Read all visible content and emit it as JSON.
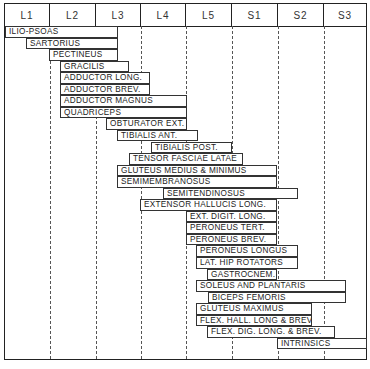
{
  "columns": [
    "L1",
    "L2",
    "L3",
    "L4",
    "L5",
    "S1",
    "S2",
    "S3"
  ],
  "colors": {
    "line": "#222222",
    "text": "#222222",
    "background": "#ffffff"
  },
  "muscles": [
    {
      "name": "ILIO-PSOAS",
      "x0": 5,
      "x1": 118
    },
    {
      "name": "SARTORIUS",
      "x0": 26,
      "x1": 118
    },
    {
      "name": "PECTINEUS",
      "x0": 49,
      "x1": 118
    },
    {
      "name": "GRACILIS",
      "x0": 60,
      "x1": 129
    },
    {
      "name": "ADDUCTOR LONG.",
      "x0": 60,
      "x1": 150
    },
    {
      "name": "ADDUCTOR BREV.",
      "x0": 60,
      "x1": 150
    },
    {
      "name": "ADDUCTOR MAGNUS",
      "x0": 60,
      "x1": 187
    },
    {
      "name": "QUADRICEPS",
      "x0": 60,
      "x1": 187
    },
    {
      "name": "OBTURATOR EXT.",
      "x0": 106,
      "x1": 187
    },
    {
      "name": "TIBIALIS ANT.",
      "x0": 117,
      "x1": 198
    },
    {
      "name": "TIBIALIS POST.",
      "x0": 151,
      "x1": 232
    },
    {
      "name": "TENSOR FASCIAE LATAE",
      "x0": 129,
      "x1": 243
    },
    {
      "name": "GLUTEUS MEDIUS & MINIMUS",
      "x0": 117,
      "x1": 277
    },
    {
      "name": "SEMIMEMBRANOSUS",
      "x0": 117,
      "x1": 277
    },
    {
      "name": "SEMITENDINOSUS",
      "x0": 163,
      "x1": 298
    },
    {
      "name": "EXTENSOR HALLUCIS LONG.",
      "x0": 140,
      "x1": 277
    },
    {
      "name": "EXT. DIGIT. LONG.",
      "x0": 186,
      "x1": 277
    },
    {
      "name": "PERONEUS TERT.",
      "x0": 186,
      "x1": 277
    },
    {
      "name": "PERONEUS BREV.",
      "x0": 186,
      "x1": 277
    },
    {
      "name": "PERONEUS LONGUS",
      "x0": 196,
      "x1": 298
    },
    {
      "name": "LAT. HIP ROTATORS",
      "x0": 196,
      "x1": 298
    },
    {
      "name": "GASTROCNEM.",
      "x0": 207,
      "x1": 277
    },
    {
      "name": "SOLEUS AND PLANTARIS",
      "x0": 196,
      "x1": 346
    },
    {
      "name": "BICEPS FEMORIS",
      "x0": 208,
      "x1": 346
    },
    {
      "name": "GLUTEUS MAXIMUS",
      "x0": 196,
      "x1": 312
    },
    {
      "name": "FLEX. HALL. LONG & BREV.",
      "x0": 196,
      "x1": 312
    },
    {
      "name": "FLEX. DIG. LONG. & BREV.",
      "x0": 207,
      "x1": 335
    },
    {
      "name": "INTRINSICS",
      "x0": 277,
      "x1": 367
    }
  ]
}
